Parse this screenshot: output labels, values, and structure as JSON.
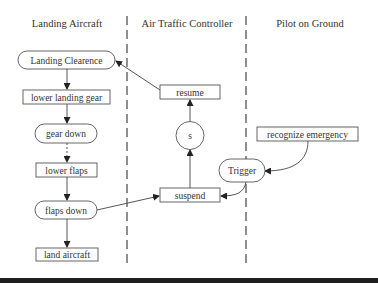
{
  "diagram": {
    "type": "swimlane-activity",
    "lanes": [
      {
        "id": "landing_aircraft",
        "title": "Landing Aircraft"
      },
      {
        "id": "atc",
        "title": "Air Traffic Controller"
      },
      {
        "id": "pilot_ground",
        "title": "Pilot on Ground"
      }
    ],
    "nodes": {
      "landing_clearence": {
        "label": "Landing Clearence",
        "shape": "rounded",
        "lane": "landing_aircraft"
      },
      "lower_landing_gear": {
        "label": "lower landing gear",
        "shape": "rect",
        "lane": "landing_aircraft"
      },
      "gear_down": {
        "label": "gear down",
        "shape": "rounded",
        "lane": "landing_aircraft"
      },
      "lower_flaps": {
        "label": "lower flaps",
        "shape": "rect",
        "lane": "landing_aircraft"
      },
      "flaps_down": {
        "label": "flaps down",
        "shape": "rounded",
        "lane": "landing_aircraft"
      },
      "land_aircraft": {
        "label": "land aircraft",
        "shape": "rect",
        "lane": "landing_aircraft"
      },
      "resume": {
        "label": "resume",
        "shape": "rect",
        "lane": "atc"
      },
      "s": {
        "label": "s",
        "shape": "circle",
        "lane": "atc"
      },
      "suspend": {
        "label": "suspend",
        "shape": "rect",
        "lane": "atc"
      },
      "trigger": {
        "label": "Trigger",
        "shape": "rounded",
        "lane": "pilot_ground"
      },
      "recognize_emergency": {
        "label": "recognize emergency",
        "shape": "rect",
        "lane": "pilot_ground"
      }
    },
    "edges": [
      {
        "from": "landing_clearence",
        "to": "lower_landing_gear",
        "style": "solid"
      },
      {
        "from": "lower_landing_gear",
        "to": "gear_down",
        "style": "solid"
      },
      {
        "from": "gear_down",
        "to": "lower_flaps",
        "style": "dotted"
      },
      {
        "from": "lower_flaps",
        "to": "flaps_down",
        "style": "solid"
      },
      {
        "from": "flaps_down",
        "to": "land_aircraft",
        "style": "solid"
      },
      {
        "from": "flaps_down",
        "to": "suspend",
        "style": "solid"
      },
      {
        "from": "suspend",
        "to": "s",
        "style": "solid"
      },
      {
        "from": "s",
        "to": "resume",
        "style": "solid"
      },
      {
        "from": "resume",
        "to": "landing_clearence",
        "style": "solid"
      },
      {
        "from": "recognize_emergency",
        "to": "trigger",
        "style": "curved"
      },
      {
        "from": "trigger",
        "to": "suspend",
        "style": "curved"
      }
    ]
  }
}
